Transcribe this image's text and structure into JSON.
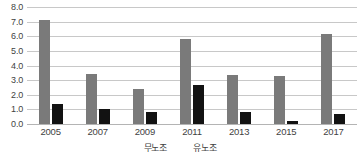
{
  "chart_data": {
    "type": "bar",
    "title": "",
    "subtitle": "",
    "xlabel": "",
    "ylabel": "",
    "categories": [
      "2005",
      "2007",
      "2009",
      "2011",
      "2013",
      "2015",
      "2017"
    ],
    "series": [
      {
        "name": "무노조",
        "color": "#7a7a7a",
        "values": [
          7.1,
          3.45,
          2.4,
          5.8,
          3.35,
          3.25,
          6.15
        ]
      },
      {
        "name": "유노조",
        "color": "#121212",
        "values": [
          1.4,
          1.05,
          0.85,
          2.65,
          0.85,
          0.2,
          0.7
        ]
      }
    ],
    "ylim": [
      0.0,
      8.0
    ],
    "ytick_step": 1.0,
    "yticks": [
      "0.0",
      "1.0",
      "2.0",
      "3.0",
      "4.0",
      "5.0",
      "6.0",
      "7.0",
      "8.0"
    ],
    "grid": "horizontal",
    "legend_position": "bottom",
    "annotations": []
  },
  "colors": {
    "gridline": "#c8c8c8",
    "baseline": "#b4b4b4",
    "text": "#3f3f3f",
    "background": "#ffffff"
  }
}
